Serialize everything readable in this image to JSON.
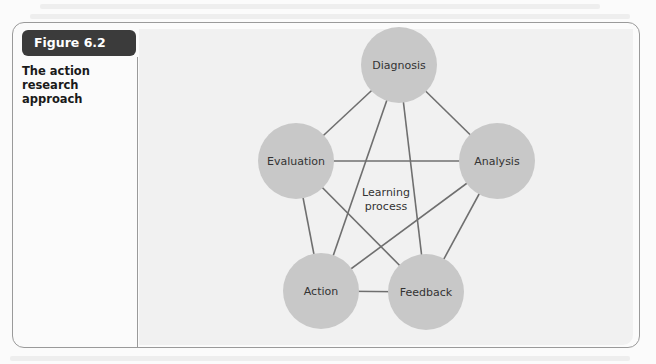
{
  "figure": {
    "label": "Figure 6.2",
    "caption": "The action research approach"
  },
  "diagram": {
    "center_label_lines": [
      "Learning",
      "process"
    ],
    "nodes": [
      {
        "id": "diagnosis",
        "label": "Diagnosis"
      },
      {
        "id": "analysis",
        "label": "Analysis"
      },
      {
        "id": "feedback",
        "label": "Feedback"
      },
      {
        "id": "action",
        "label": "Action"
      },
      {
        "id": "evaluation",
        "label": "Evaluation"
      }
    ],
    "edges": [
      [
        "diagnosis",
        "evaluation"
      ],
      [
        "diagnosis",
        "analysis"
      ],
      [
        "diagnosis",
        "action"
      ],
      [
        "diagnosis",
        "feedback"
      ],
      [
        "evaluation",
        "analysis"
      ],
      [
        "evaluation",
        "action"
      ],
      [
        "evaluation",
        "feedback"
      ],
      [
        "analysis",
        "action"
      ],
      [
        "analysis",
        "feedback"
      ],
      [
        "action",
        "feedback"
      ]
    ],
    "colors": {
      "node_fill": "#c8c8c8",
      "edge": "#6f6f6f",
      "badge": "#3b3b3b"
    }
  }
}
